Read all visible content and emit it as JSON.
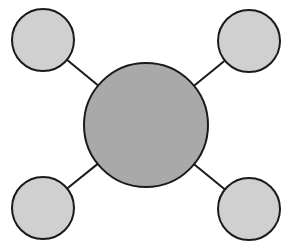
{
  "diagram": {
    "type": "hub-and-spoke",
    "width": 289,
    "height": 251,
    "colors": {
      "background": "#ffffff",
      "stroke": "#1a1a1a",
      "hub_fill": "#a9a9a9",
      "spoke_fill": "#d0d0d0"
    },
    "hub": {
      "id": "center",
      "cx": 146,
      "cy": 125,
      "r": 62
    },
    "spokes": [
      {
        "id": "top-left",
        "cx": 43,
        "cy": 40,
        "r": 31
      },
      {
        "id": "top-right",
        "cx": 249,
        "cy": 41,
        "r": 31
      },
      {
        "id": "bottom-left",
        "cx": 43,
        "cy": 208,
        "r": 31
      },
      {
        "id": "bottom-right",
        "cx": 249,
        "cy": 209,
        "r": 31
      }
    ]
  }
}
